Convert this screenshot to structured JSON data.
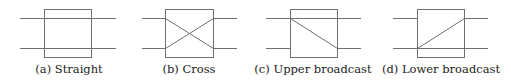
{
  "figure": {
    "panels": [
      {
        "id": "a",
        "caption": "(a) Straight",
        "state": "straight",
        "box": {
          "x": 44,
          "y": 9,
          "w": 47,
          "h": 48
        },
        "lines_x": [
          20,
          116
        ],
        "wire_y": [
          18,
          48
        ],
        "caption_cx": 69
      },
      {
        "id": "b",
        "caption": "(b) Cross",
        "state": "cross",
        "box": {
          "x": 165,
          "y": 9,
          "w": 48,
          "h": 48
        },
        "lines_x": [
          142,
          237
        ],
        "wire_y": [
          18,
          48
        ],
        "caption_cx": 189
      },
      {
        "id": "c",
        "caption": "(c) Upper broadcast",
        "state": "upper-broadcast",
        "box": {
          "x": 290,
          "y": 9,
          "w": 47,
          "h": 48
        },
        "lines_x": [
          266,
          361
        ],
        "wire_y": [
          18,
          48
        ],
        "caption_cx": 313
      },
      {
        "id": "d",
        "caption": "(d) Lower broadcast",
        "state": "lower-broadcast",
        "box": {
          "x": 417,
          "y": 9,
          "w": 47,
          "h": 48
        },
        "lines_x": [
          393,
          488
        ],
        "wire_y": [
          18,
          48
        ],
        "caption_cx": 441
      }
    ],
    "colors": {
      "stroke": "#707070",
      "text": "#222222",
      "background": "#ffffff"
    }
  }
}
